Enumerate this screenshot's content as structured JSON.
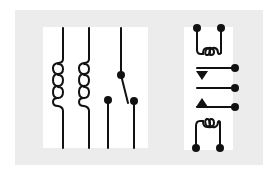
{
  "figure": {
    "colors": {
      "page": "#ffffff",
      "panel": "#ececec",
      "symbol_bg": "#ffffff",
      "stroke": "#111111"
    }
  },
  "symbols": [
    {
      "id": "relay-coil-1",
      "type": "coil",
      "orientation": "vertical",
      "loops": 3
    },
    {
      "id": "relay-coil-2",
      "type": "coil",
      "orientation": "vertical",
      "loops": 3
    },
    {
      "id": "spdt-switch",
      "type": "switch",
      "contacts": 3,
      "state": "common-to-right"
    },
    {
      "id": "relay-package-top-coil",
      "type": "coil",
      "orientation": "horizontal",
      "loops": 3,
      "terminals": 2
    },
    {
      "id": "relay-package-contacts",
      "type": "contacts",
      "terminals": 3,
      "arrows": [
        "down",
        "none",
        "up"
      ]
    },
    {
      "id": "relay-package-bottom-coil",
      "type": "coil",
      "orientation": "horizontal",
      "loops": 3,
      "terminals": 2
    }
  ]
}
